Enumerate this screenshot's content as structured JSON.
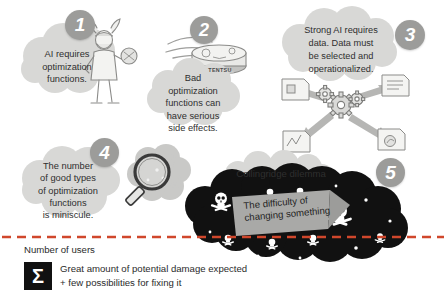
{
  "figure": {
    "type": "infographic",
    "background": "#ffffff",
    "badge_color": "#9c9c9a",
    "cloud_color": "#d8d8d6",
    "dark_cloud_color": "#111111",
    "divider_color": "#d0472c",
    "text_color": "#2f2f2f"
  },
  "panels": [
    {
      "number": "1",
      "text": "AI requires\noptimization\nfunctions.",
      "illustration": "viking-figure-icon"
    },
    {
      "number": "2",
      "text": "Bad\noptimization\nfunctions can\nhave serious\nside effects.",
      "illustration": "robot-vacuum-icon",
      "illustration_label": "TENTSU"
    },
    {
      "number": "3",
      "text": "Strong AI requires\ndata. Data must\nbe selected and\noperationalized.",
      "illustration": "gears-and-documents-icon"
    },
    {
      "number": "4",
      "text": "The number\nof good types\nof optimization\nfunctions\nis miniscule.",
      "illustration": "magnifying-glass-over-skulls-icon"
    },
    {
      "number": "5",
      "text": "Collingridge dilemma",
      "banner_text": "The difficulty of\nchanging something",
      "illustration": "dark-cloud-with-skulls-icon"
    }
  ],
  "axis": {
    "label": "Number of users"
  },
  "legend": {
    "icon": "sigma-icon",
    "icon_glyph": "Σ",
    "line1": "Great amount of potential damage expected",
    "line2": "+ few possibilities for fixing it"
  }
}
